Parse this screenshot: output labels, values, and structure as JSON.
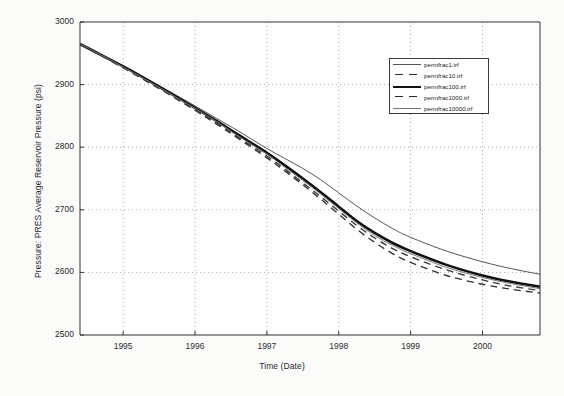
{
  "chart_data": {
    "type": "line",
    "title": "",
    "xlabel": "Time (Date)",
    "ylabel": "Pressure: PRES Average Reservoir Pressure (psi)",
    "xlim": [
      1994.4,
      2000.8
    ],
    "ylim": [
      2500,
      3000
    ],
    "xticks": [
      "1995",
      "1996",
      "1997",
      "1998",
      "1999",
      "2000"
    ],
    "xtick_values": [
      1995,
      1996,
      1997,
      1998,
      1999,
      2000
    ],
    "yticks": [
      "2500",
      "2600",
      "2700",
      "2800",
      "2900",
      "3000"
    ],
    "ytick_values": [
      2500,
      2600,
      2700,
      2800,
      2900,
      3000
    ],
    "grid": true,
    "grid_style": "dotted",
    "legend_position": "upper-right",
    "x": [
      1994.4,
      1994.7,
      1995.0,
      1995.3,
      1995.6,
      1996.0,
      1996.3,
      1996.6,
      1997.0,
      1997.25,
      1997.5,
      1997.75,
      1998.0,
      1998.25,
      1998.5,
      1998.75,
      1999.0,
      1999.5,
      2000.0,
      2000.4,
      2000.8
    ],
    "series": [
      {
        "name": "permfrac1.irf",
        "style": "solid-thin",
        "color": "#555555",
        "values": [
          2965,
          2948,
          2930,
          2911,
          2892,
          2866,
          2846,
          2826,
          2798,
          2782,
          2766,
          2748,
          2727,
          2706,
          2687,
          2670,
          2656,
          2634,
          2617,
          2606,
          2597
        ]
      },
      {
        "name": "permfrac10.irf",
        "style": "dashed",
        "color": "#333333",
        "values": [
          2964,
          2946,
          2927,
          2907,
          2887,
          2859,
          2837,
          2814,
          2783,
          2762,
          2740,
          2717,
          2693,
          2669,
          2648,
          2630,
          2616,
          2595,
          2581,
          2573,
          2567
        ]
      },
      {
        "name": "permfrac100.irf",
        "style": "solid-thick",
        "color": "#111111",
        "values": [
          2965,
          2947,
          2929,
          2910,
          2890,
          2863,
          2842,
          2820,
          2791,
          2771,
          2750,
          2728,
          2705,
          2682,
          2663,
          2647,
          2634,
          2612,
          2595,
          2585,
          2577
        ]
      },
      {
        "name": "permfrac1000.irf",
        "style": "dashed",
        "color": "#3a3a3a",
        "values": [
          2964,
          2946,
          2927,
          2908,
          2888,
          2860,
          2839,
          2816,
          2786,
          2765,
          2743,
          2721,
          2698,
          2675,
          2655,
          2638,
          2625,
          2604,
          2588,
          2578,
          2571
        ]
      },
      {
        "name": "permfrac10000.irf",
        "style": "solid-thin",
        "color": "#777777",
        "values": [
          2965,
          2947,
          2928,
          2909,
          2889,
          2862,
          2841,
          2818,
          2789,
          2768,
          2747,
          2725,
          2702,
          2679,
          2659,
          2643,
          2630,
          2608,
          2592,
          2582,
          2574
        ]
      }
    ]
  },
  "legend": {
    "entries": [
      {
        "label": "permfrac1.irf"
      },
      {
        "label": "permfrac10.irf"
      },
      {
        "label": "permfrac100.irf"
      },
      {
        "label": "permfrac1000.irf"
      },
      {
        "label": "permfrac10000.irf"
      }
    ]
  }
}
